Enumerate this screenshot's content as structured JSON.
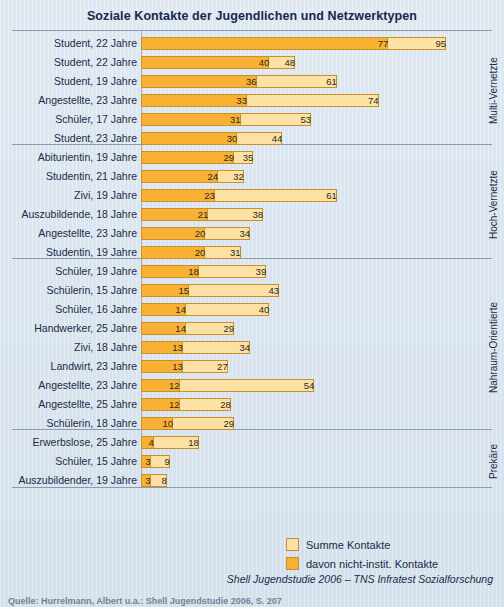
{
  "chart_data": {
    "type": "bar",
    "orientation": "horizontal",
    "title": "Soziale Kontakte der Jugendlichen und Netzwerktypen",
    "xlabel": "",
    "ylabel": "",
    "grid": false,
    "xlim": [
      0,
      95
    ],
    "legend_position": "bottom-right",
    "series": [
      {
        "name": "Summe Kontakte",
        "color": "#fbe2a4"
      },
      {
        "name": "davon nicht-instit. Kontakte",
        "color": "#f9b134"
      }
    ],
    "categories": [
      "Student, 22 Jahre",
      "Student, 22 Jahre",
      "Student, 19 Jahre",
      "Angestellte, 23 Jahre",
      "Schüler, 17 Jahre",
      "Student, 23 Jahre",
      "Abiturientin, 19 Jahre",
      "Studentin, 21 Jahre",
      "Zivi, 19 Jahre",
      "Auszubildende, 18 Jahre",
      "Angestellte, 23 Jahre",
      "Studentin, 19 Jahre",
      "Schüler, 19 Jahre",
      "Schülerin, 15 Jahre",
      "Schüler, 16 Jahre",
      "Handwerker, 25 Jahre",
      "Zivi, 18 Jahre",
      "Landwirt, 23 Jahre",
      "Angestellte, 23 Jahre",
      "Angestellte, 25 Jahre",
      "Schülerin, 18 Jahre",
      "Erwerbslose, 25 Jahre",
      "Schüler, 15 Jahre",
      "Auszubildender, 19 Jahre"
    ],
    "values_total": [
      95,
      48,
      61,
      74,
      53,
      44,
      35,
      32,
      61,
      38,
      34,
      31,
      39,
      43,
      40,
      29,
      34,
      27,
      54,
      28,
      29,
      18,
      9,
      8
    ],
    "values_inner": [
      77,
      40,
      36,
      33,
      31,
      30,
      29,
      24,
      23,
      21,
      20,
      20,
      18,
      15,
      14,
      14,
      13,
      13,
      12,
      12,
      10,
      4,
      3,
      3
    ],
    "groups": [
      {
        "label": "Multi-Vernetzte",
        "start": 0,
        "count": 6
      },
      {
        "label": "Hoch-Vernetzte",
        "start": 6,
        "count": 6
      },
      {
        "label": "Nahraum-Orientierte",
        "start": 12,
        "count": 9
      },
      {
        "label": "Prekäre",
        "start": 21,
        "count": 3
      }
    ]
  },
  "legend": {
    "items": [
      {
        "label": "Summe Kontakte",
        "color": "#fbe2a4"
      },
      {
        "label": "davon nicht-instit. Kontakte",
        "color": "#f9b134"
      }
    ]
  },
  "source": "Shell Jugendstudie 2006 – TNS Infratest Sozialforschung",
  "footnote": "Quelle: Hurrelmann, Albert u.a.: Shell Jugendstudie 2006, S. 207",
  "colors": {
    "background": "#dce6ef",
    "text": "#1b2b4b",
    "bar_total": "#fbe2a4",
    "bar_inner": "#f9b134",
    "bar_border": "#c8902c",
    "separator": "#8b9bb0"
  }
}
